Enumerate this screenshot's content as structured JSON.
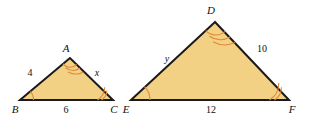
{
  "figure": {
    "background_color": "#ffffff",
    "fill_color": "#f2d184",
    "outline_color": "#1a1a1a",
    "arc_color": "#e08a3c",
    "triangles": [
      {
        "name": "triangle-abc",
        "vertices": [
          {
            "label": "A",
            "position": "apex",
            "arc_count": 3
          },
          {
            "label": "B",
            "position": "bottom-left",
            "arc_count": 1
          },
          {
            "label": "C",
            "position": "bottom-right",
            "arc_count": 2
          }
        ],
        "sides": [
          {
            "name": "side-ab",
            "label": "4",
            "is_variable": false
          },
          {
            "name": "side-ac",
            "label": "x",
            "is_variable": true
          },
          {
            "name": "side-bc",
            "label": "6",
            "is_variable": false
          }
        ]
      },
      {
        "name": "triangle-def",
        "vertices": [
          {
            "label": "D",
            "position": "apex",
            "arc_count": 3
          },
          {
            "label": "E",
            "position": "bottom-left",
            "arc_count": 1
          },
          {
            "label": "F",
            "position": "bottom-right",
            "arc_count": 2
          }
        ],
        "sides": [
          {
            "name": "side-de",
            "label": "y",
            "is_variable": true
          },
          {
            "name": "side-df",
            "label": "10",
            "is_variable": false
          },
          {
            "name": "side-ef",
            "label": "12",
            "is_variable": false
          }
        ]
      }
    ]
  }
}
